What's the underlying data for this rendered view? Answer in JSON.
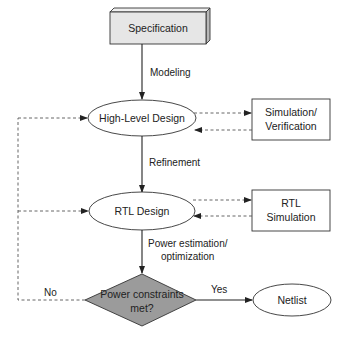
{
  "diagram": {
    "nodes": {
      "specification": {
        "label": "Specification",
        "shape": "3d-box",
        "fill": "#e6e6e6"
      },
      "high_level_design": {
        "label": "High-Level Design",
        "shape": "ellipse"
      },
      "simulation_verification": {
        "line1": "Simulation/",
        "line2": "Verification",
        "shape": "box"
      },
      "rtl_design": {
        "label": "RTL Design",
        "shape": "ellipse"
      },
      "rtl_simulation": {
        "line1": "RTL",
        "line2": "Simulation",
        "shape": "box"
      },
      "power_check": {
        "line1": "Power constraints",
        "line2": "met?",
        "shape": "diamond",
        "fill": "#9b9b9b"
      },
      "netlist": {
        "label": "Netlist",
        "shape": "ellipse"
      }
    },
    "edges": {
      "modeling": "Modeling",
      "refinement": "Refinement",
      "power_est_1": "Power estimation/",
      "power_est_2": "optimization",
      "yes": "Yes",
      "no": "No"
    }
  }
}
